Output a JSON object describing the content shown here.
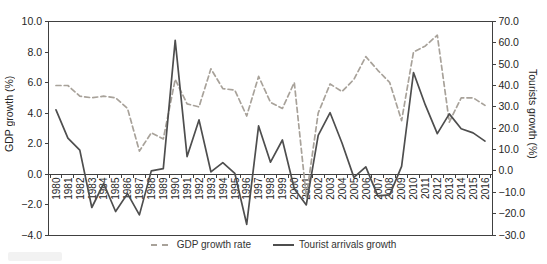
{
  "chart_data": {
    "type": "line",
    "title": "",
    "x": [
      "1980",
      "1981",
      "1982",
      "1983",
      "1984",
      "1985",
      "1986",
      "1987",
      "1988",
      "1989",
      "1990",
      "1991",
      "1992",
      "1993",
      "1994",
      "1995",
      "1996",
      "1997",
      "1998",
      "1999",
      "2000",
      "2001",
      "2002",
      "2003",
      "2004",
      "2005",
      "2006",
      "2007",
      "2008",
      "2009",
      "2010",
      "2011",
      "2012",
      "2013",
      "2014",
      "2015",
      "2016"
    ],
    "series": [
      {
        "name": "GDP growth rate",
        "axis": "left",
        "line_style": "dashed",
        "color": "#a8a29a",
        "values": [
          5.8,
          5.8,
          5.1,
          5.0,
          5.1,
          5.0,
          4.3,
          1.5,
          2.7,
          2.3,
          6.2,
          4.6,
          4.4,
          6.9,
          5.6,
          5.5,
          3.8,
          6.4,
          4.7,
          4.3,
          6.0,
          -1.5,
          4.0,
          5.9,
          5.4,
          6.2,
          7.7,
          6.8,
          6.0,
          3.5,
          8.0,
          8.4,
          9.1,
          3.4,
          5.0,
          5.0,
          4.5
        ]
      },
      {
        "name": "Tourist arrivals growth",
        "axis": "right",
        "line_style": "solid",
        "color": "#4e4e4e",
        "values": [
          28.6,
          15.4,
          9.7,
          -17.1,
          -5.9,
          -19.0,
          -10.6,
          -20.6,
          0.0,
          1.1,
          61.2,
          6.7,
          23.9,
          -0.4,
          3.9,
          -1.1,
          -25.0,
          21.1,
          4.1,
          14.5,
          -8.3,
          -15.9,
          16.7,
          27.3,
          13.1,
          -3.0,
          1.9,
          -11.7,
          -11.2,
          2.2,
          46.1,
          30.8,
          17.5,
          26.7,
          19.8,
          17.8,
          14.0
        ]
      }
    ],
    "left_axis": {
      "label": "GDP growth (%)",
      "min": -4,
      "max": 10,
      "tick_step": 2,
      "ticks": [
        "10.0",
        "8.0",
        "6.0",
        "4.0",
        "2.0",
        "0.0",
        "−2.0",
        "−4.0"
      ]
    },
    "right_axis": {
      "label": "Tourists growth (%)",
      "min": -30,
      "max": 70,
      "tick_step": 10,
      "ticks": [
        "70.0",
        "60.0",
        "50.0",
        "40.0",
        "30.0",
        "20.0",
        "10.0",
        "0.0",
        "−10.0",
        "−20.0",
        "−30.0"
      ]
    },
    "grid": false,
    "legend_position": "bottom"
  },
  "legend": {
    "items": [
      {
        "label": "GDP growth rate",
        "style": "dashed"
      },
      {
        "label": "Tourist arrivals growth",
        "style": "solid"
      }
    ]
  },
  "colors": {
    "axis": "#404040",
    "text": "#262626",
    "legend_text": "#333333",
    "gdp_line": "#a8a29a",
    "tourist_line": "#4e4e4e",
    "background": "#ffffff",
    "caption_box": "#f2f2f2"
  }
}
